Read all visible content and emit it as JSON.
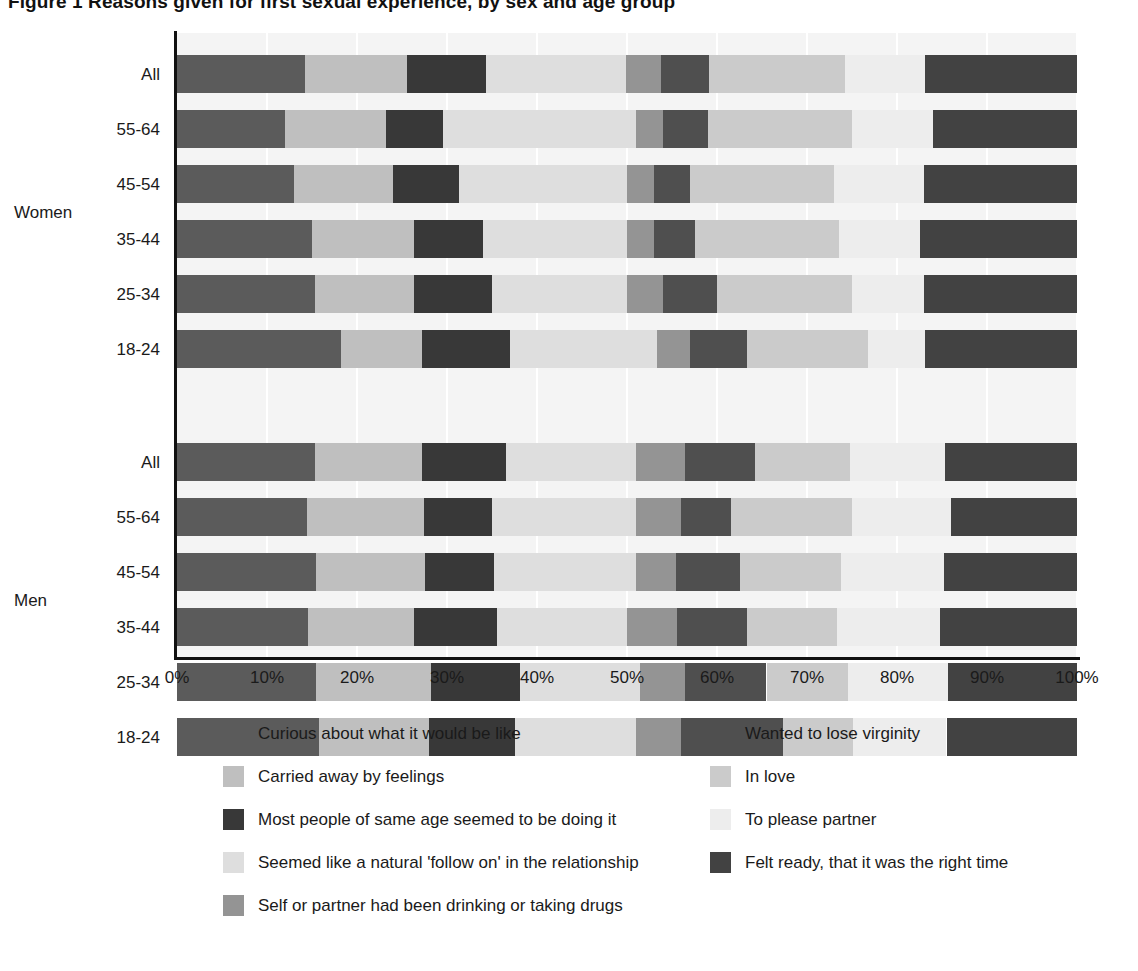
{
  "title": "Figure 1  Reasons given for first sexual experience, by sex and age group",
  "axis": {
    "x_label": "",
    "y_label": "",
    "x_ticks": [
      "0%",
      "10%",
      "20%",
      "30%",
      "40%",
      "50%",
      "60%",
      "70%",
      "80%",
      "90%",
      "100%"
    ],
    "group_labels": [
      "Women",
      "Men"
    ]
  },
  "legend": {
    "left": [
      {
        "label": "Curious about what it would be like",
        "color": "#5b5b5b",
        "key": "curious"
      },
      {
        "label": "Carried away by feelings",
        "color": "#bfbfbf",
        "key": "carried_away"
      },
      {
        "label": "Most people of same age seemed to be doing it",
        "color": "#383838",
        "key": "most_people"
      },
      {
        "label": "Seemed like a natural 'follow on' in the relationship",
        "color": "#dedede",
        "key": "follow_on"
      },
      {
        "label": "Self or partner had been drinking or taking drugs",
        "color": "#949494",
        "key": "drinking"
      }
    ],
    "right": [
      {
        "label": "Wanted to lose virginity",
        "color": "#4f4f4f",
        "key": "virginity"
      },
      {
        "label": "In love",
        "color": "#cbcbcb",
        "key": "in_love"
      },
      {
        "label": "To please partner",
        "color": "#ededed",
        "key": "please_partner"
      },
      {
        "label": "Felt ready, that it was the right time",
        "color": "#424242",
        "key": "felt_ready"
      }
    ]
  },
  "chart_data": {
    "type": "bar",
    "orientation": "horizontal",
    "stacked": true,
    "normalized": true,
    "title": "Figure 1  Reasons given for first sexual experience, by sex and age group",
    "xlabel": "",
    "ylabel": "",
    "xlim": [
      0,
      100
    ],
    "xticks": [
      0,
      10,
      20,
      30,
      40,
      50,
      60,
      70,
      80,
      90,
      100
    ],
    "grid": true,
    "legend_position": "bottom",
    "series": [
      {
        "name": "Curious about what it would be like",
        "color": "#5b5b5b",
        "values": [
          14.2,
          12.0,
          13.0,
          15.0,
          15.3,
          18.2,
          15.3,
          14.4,
          15.4,
          14.6,
          15.4,
          15.8
        ]
      },
      {
        "name": "Carried away by feelings",
        "color": "#bfbfbf",
        "values": [
          11.4,
          11.2,
          11.0,
          11.3,
          11.0,
          9.0,
          11.9,
          13.0,
          12.2,
          11.7,
          12.8,
          12.2
        ]
      },
      {
        "name": "Most people of same age seemed to be doing it",
        "color": "#383838",
        "values": [
          8.7,
          6.4,
          7.3,
          7.7,
          8.7,
          9.8,
          9.4,
          7.6,
          7.6,
          9.3,
          9.9,
          9.6
        ]
      },
      {
        "name": "Seemed like a natural 'follow on' in the relationship",
        "color": "#dedede",
        "values": [
          15.6,
          21.4,
          18.7,
          16.0,
          15.0,
          16.3,
          14.4,
          16.0,
          15.8,
          14.4,
          13.3,
          13.4
        ]
      },
      {
        "name": "Self or partner had been drinking or taking drugs",
        "color": "#949494",
        "values": [
          3.9,
          3.0,
          3.0,
          3.0,
          4.0,
          3.7,
          5.4,
          5.0,
          4.4,
          5.5,
          5.0,
          5.0
        ]
      },
      {
        "name": "Wanted to lose virginity",
        "color": "#4f4f4f",
        "values": [
          5.3,
          5.0,
          4.0,
          4.6,
          6.0,
          6.3,
          7.8,
          5.6,
          7.2,
          7.8,
          9.1,
          11.3
        ]
      },
      {
        "name": "In love",
        "color": "#cbcbcb",
        "values": [
          15.1,
          16.0,
          16.0,
          16.0,
          15.0,
          13.5,
          10.6,
          13.4,
          11.2,
          10.0,
          9.0,
          7.8
        ]
      },
      {
        "name": "To please partner",
        "color": "#ededed",
        "values": [
          8.9,
          9.0,
          10.0,
          9.0,
          8.0,
          6.3,
          10.5,
          11.0,
          11.4,
          11.5,
          11.2,
          10.4
        ]
      },
      {
        "name": "Felt ready, that it was the right time",
        "color": "#424242",
        "values": [
          16.9,
          16.0,
          17.0,
          17.4,
          17.0,
          16.9,
          14.7,
          14.0,
          14.8,
          15.2,
          14.3,
          14.5
        ]
      }
    ],
    "groups": [
      {
        "name": "Women",
        "categories": [
          "All",
          "55-64",
          "45-54",
          "35-44",
          "25-34",
          "18-24"
        ],
        "rows": [
          {
            "label": "All",
            "values": [
              14.2,
              11.4,
              8.7,
              15.6,
              3.9,
              5.3,
              15.1,
              8.9,
              16.9
            ]
          },
          {
            "label": "55-64",
            "values": [
              12.0,
              11.2,
              6.4,
              21.4,
              3.0,
              5.0,
              16.0,
              9.0,
              16.0
            ]
          },
          {
            "label": "45-54",
            "values": [
              13.0,
              11.0,
              7.3,
              18.7,
              3.0,
              4.0,
              16.0,
              10.0,
              17.0
            ]
          },
          {
            "label": "35-44",
            "values": [
              15.0,
              11.3,
              7.7,
              16.0,
              3.0,
              4.6,
              16.0,
              9.0,
              17.4
            ]
          },
          {
            "label": "25-34",
            "values": [
              15.3,
              11.0,
              8.7,
              15.0,
              4.0,
              6.0,
              15.0,
              8.0,
              17.0
            ]
          },
          {
            "label": "18-24",
            "values": [
              18.2,
              9.0,
              9.8,
              16.3,
              3.7,
              6.3,
              13.5,
              6.3,
              16.9
            ]
          }
        ]
      },
      {
        "name": "Men",
        "categories": [
          "All",
          "55-64",
          "45-54",
          "35-44",
          "25-34",
          "18-24"
        ],
        "rows": [
          {
            "label": "All",
            "values": [
              15.3,
              11.9,
              9.4,
              14.4,
              5.4,
              7.8,
              10.6,
              10.5,
              14.7
            ]
          },
          {
            "label": "55-64",
            "values": [
              14.4,
              13.0,
              7.6,
              16.0,
              5.0,
              5.6,
              13.4,
              11.0,
              14.0
            ]
          },
          {
            "label": "45-54",
            "values": [
              15.4,
              12.2,
              7.6,
              15.8,
              4.4,
              7.2,
              11.2,
              11.4,
              14.8
            ]
          },
          {
            "label": "35-44",
            "values": [
              14.6,
              11.7,
              9.3,
              14.4,
              5.5,
              7.8,
              10.0,
              11.5,
              15.2
            ]
          },
          {
            "label": "25-34",
            "values": [
              15.4,
              12.8,
              9.9,
              13.3,
              5.0,
              9.1,
              9.0,
              11.2,
              14.3
            ]
          },
          {
            "label": "18-24",
            "values": [
              15.8,
              12.2,
              9.6,
              13.4,
              5.0,
              11.3,
              7.8,
              10.4,
              14.5
            ]
          }
        ]
      }
    ]
  },
  "layout": {
    "plot_left": 177,
    "plot_right": 1077,
    "plot_top": 33,
    "row_height": 38,
    "row_pitch": 55,
    "group_gap": 58
  }
}
